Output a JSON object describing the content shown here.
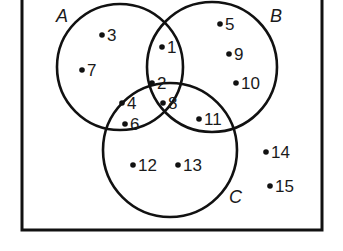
{
  "diagram": {
    "type": "venn",
    "universe": {
      "x": 22,
      "y": -6,
      "width": 300,
      "height": 236
    },
    "sets": [
      {
        "name": "A",
        "cx": 120,
        "cy": 67,
        "r": 63,
        "label_x": 56,
        "label_y": 22
      },
      {
        "name": "B",
        "cx": 212,
        "cy": 67,
        "r": 65,
        "label_x": 270,
        "label_y": 22
      },
      {
        "name": "C",
        "cx": 170,
        "cy": 150,
        "r": 67,
        "label_x": 229,
        "label_y": 203
      }
    ],
    "elements": [
      {
        "value": "3",
        "region": "A only",
        "x": 102,
        "y": 40
      },
      {
        "value": "7",
        "region": "A only",
        "x": 82,
        "y": 75
      },
      {
        "value": "1",
        "region": "A∩B only",
        "x": 162,
        "y": 52
      },
      {
        "value": "5",
        "region": "B only",
        "x": 220,
        "y": 29
      },
      {
        "value": "9",
        "region": "B only",
        "x": 229,
        "y": 59
      },
      {
        "value": "10",
        "region": "B only",
        "x": 236,
        "y": 88
      },
      {
        "value": "2",
        "region": "A∩B∩C",
        "x": 152,
        "y": 88
      },
      {
        "value": "8",
        "region": "A∩B∩C",
        "x": 163,
        "y": 108
      },
      {
        "value": "4",
        "region": "A∩C only",
        "x": 122,
        "y": 108
      },
      {
        "value": "6",
        "region": "A∩C only",
        "x": 125,
        "y": 129
      },
      {
        "value": "11",
        "region": "B∩C only",
        "x": 199,
        "y": 124
      },
      {
        "value": "12",
        "region": "C only",
        "x": 133,
        "y": 170
      },
      {
        "value": "13",
        "region": "C only",
        "x": 178,
        "y": 170
      },
      {
        "value": "14",
        "region": "outside",
        "x": 266,
        "y": 157
      },
      {
        "value": "15",
        "region": "outside",
        "x": 270,
        "y": 191
      }
    ],
    "stroke_color": "#111111",
    "background_color": "#ffffff"
  }
}
